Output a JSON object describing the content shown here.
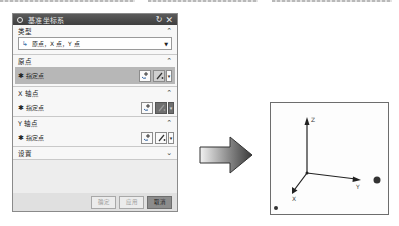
{
  "dialog": {
    "title": "基准坐标系",
    "title_icons": [
      "gear-icon",
      "reset-icon",
      "close-icon"
    ],
    "sections": {
      "type": {
        "label": "类型",
        "expanded": true,
        "selected_option": "原点，X 点，Y 点"
      },
      "origin": {
        "label": "原点",
        "expanded": true,
        "row_label": "指定点",
        "active": true
      },
      "x_axis_point": {
        "label": "X 轴点",
        "expanded": true,
        "row_label": "指定点"
      },
      "y_axis_point": {
        "label": "Y 轴点",
        "expanded": true,
        "row_label": "指定点"
      },
      "settings": {
        "label": "设置",
        "expanded": false
      }
    },
    "buttons": {
      "ok": "确定",
      "apply": "应用",
      "cancel": "取消"
    }
  },
  "viewport": {
    "axes": {
      "x": "X",
      "y": "Y",
      "z": "Z"
    }
  },
  "icons": {
    "chevron_up": "^",
    "chevron_down": "v",
    "required_star": "✱",
    "dropdown": "▼"
  }
}
